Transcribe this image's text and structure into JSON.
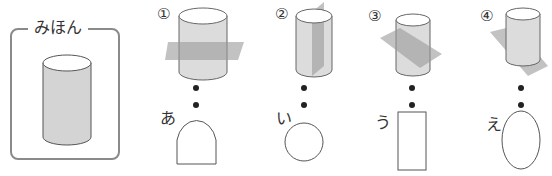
{
  "sample": {
    "title": "みほん"
  },
  "items": [
    {
      "number": "①",
      "label": "あ",
      "cut": "horizontal",
      "result_shape": "arch"
    },
    {
      "number": "②",
      "label": "い",
      "cut": "vertical",
      "result_shape": "circle"
    },
    {
      "number": "③",
      "label": "う",
      "cut": "diagonal",
      "result_shape": "rectangle"
    },
    {
      "number": "④",
      "label": "え",
      "cut": "steep-diagonal",
      "result_shape": "ellipse"
    }
  ],
  "colors": {
    "cylinder_body": "#d4d4d4",
    "plane": "#9a9a9a",
    "stroke": "#555555",
    "frame": "#8a8a8a"
  }
}
